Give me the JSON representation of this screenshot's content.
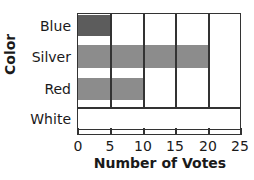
{
  "chart_data": {
    "type": "bar",
    "orientation": "horizontal",
    "title": "",
    "categories": [
      "Blue",
      "Silver",
      "Red",
      "White"
    ],
    "values": [
      5,
      20,
      10,
      0
    ],
    "xlabel": "Number of Votes",
    "ylabel": "Color",
    "xlim": [
      0,
      25
    ],
    "xticks": [
      "0",
      "5",
      "10",
      "15",
      "20",
      "25"
    ],
    "grid": true,
    "legend": null,
    "colors": {
      "Blue": "#5c5c5c",
      "Silver": "#8c8c8c",
      "Red": "#8c8c8c",
      "White": "#ffffff"
    }
  }
}
